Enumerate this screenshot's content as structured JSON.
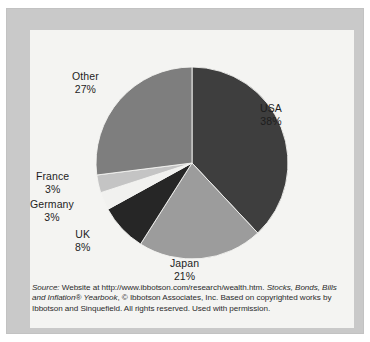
{
  "figure": {
    "background_color": "#c9c9c9",
    "panel_color": "#f4f4f2",
    "text_color": "#1d1d1d"
  },
  "chart_data": {
    "type": "pie",
    "title": "",
    "subtitle": "",
    "xlabel": "",
    "ylabel": "",
    "legend_position": "none",
    "grid": false,
    "start_angle_deg": 0,
    "direction": "clockwise",
    "categories": [
      "USA",
      "Japan",
      "UK",
      "Germany",
      "France",
      "Other"
    ],
    "values": [
      38,
      21,
      8,
      3,
      3,
      27
    ],
    "unit": "%",
    "colors": [
      "#3e3e3e",
      "#9c9c9c",
      "#262626",
      "#f1f1ef",
      "#c4c4c4",
      "#7e7e7e"
    ],
    "slices": [
      {
        "label": "USA",
        "value": 38,
        "display": "38%",
        "color": "#3e3e3e"
      },
      {
        "label": "Japan",
        "value": 21,
        "display": "21%",
        "color": "#9c9c9c"
      },
      {
        "label": "UK",
        "value": 8,
        "display": "8%",
        "color": "#262626"
      },
      {
        "label": "Germany",
        "value": 3,
        "display": "3%",
        "color": "#f1f1ef"
      },
      {
        "label": "France",
        "value": 3,
        "display": "3%",
        "color": "#c4c4c4"
      },
      {
        "label": "Other",
        "value": 27,
        "display": "27%",
        "color": "#7e7e7e"
      }
    ]
  },
  "labels": {
    "other": {
      "name": "Other",
      "pct": "27%"
    },
    "usa": {
      "name": "USA",
      "pct": "38%"
    },
    "france": {
      "name": "France",
      "pct": "3%"
    },
    "germany": {
      "name": "Germany",
      "pct": "3%"
    },
    "uk": {
      "name": "UK",
      "pct": "8%"
    },
    "japan": {
      "name": "Japan",
      "pct": "21%"
    }
  },
  "source": {
    "line1_italic_lead": "Source:",
    "line1_a": " Website at http://www.ibbotson.com/research/wealth.htm. ",
    "line1_italic_tail": "Stocks, Bonds, Bills",
    "line2_italic_lead": "and Inflation",
    "line2_a": "® ",
    "line2_italic_mid": "Yearbook",
    "line2_b": ", © Ibbotson Associates, Inc. Based on copyrighted works by",
    "line3": "Ibbotson and Sinquefield. All rights reserved. Used with permission."
  }
}
